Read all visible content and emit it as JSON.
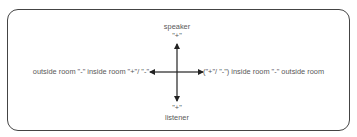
{
  "diagram": {
    "top": {
      "label": "speaker",
      "sign": "\"+\""
    },
    "bottom": {
      "sign": "\"+\"",
      "label": "listener"
    },
    "left": {
      "text": "outside room \"-\" inside room \"+\"/ \"-\""
    },
    "right": {
      "text": "(\"+\"/ \"-\") inside room \"-\" outside room"
    },
    "colors": {
      "border": "#444444",
      "arrow": "#222222",
      "text": "#585858"
    }
  }
}
